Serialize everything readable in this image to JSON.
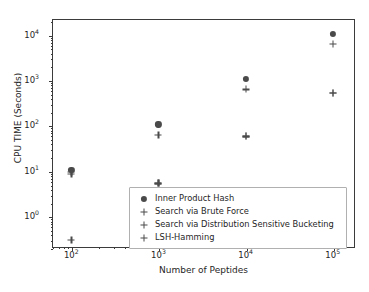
{
  "chart_data": {
    "type": "scatter",
    "title": "",
    "xlabel": "Number of Peptides",
    "ylabel": "CPU TIME (Seconds)",
    "xscale": "log",
    "yscale": "log",
    "xlim": [
      60,
      180000
    ],
    "ylim": [
      0.2,
      22000
    ],
    "grid": false,
    "legend_position": "lower center",
    "xticklabels": [
      "10²",
      "10³",
      "10⁴",
      "10⁵"
    ],
    "xtickvalues": [
      100,
      1000,
      10000,
      100000
    ],
    "yticklabels": [
      "10⁰",
      "10¹",
      "10²",
      "10³",
      "10⁴"
    ],
    "ytickvalues": [
      1,
      10,
      100,
      1000,
      10000
    ],
    "x": [
      100,
      1000,
      10000,
      100000
    ],
    "series": [
      {
        "name": "Inner Product Hash",
        "marker": "circle",
        "color": "#4a4a4a",
        "x": [
          100,
          1000,
          10000,
          100000
        ],
        "values": [
          10.5,
          105,
          1050,
          10500
        ]
      },
      {
        "name": "Search via Brute Force",
        "marker": "plus",
        "color": "#4a4a4a",
        "x": [
          100,
          1000,
          10000,
          100000
        ],
        "values": [
          8.5,
          62,
          620,
          6200
        ]
      },
      {
        "name": "Search via Distribution Sensitive Bucketing",
        "marker": "plus",
        "color": "#4a4a4a",
        "x": [
          100,
          1000,
          10000,
          100000
        ],
        "values": [
          9.5,
          5.3,
          57,
          530
        ]
      },
      {
        "name": "LSH-Hamming",
        "marker": "plus",
        "color": "#4a4a4a",
        "x": [
          100,
          1000,
          10000,
          100000
        ],
        "values": [
          0.3,
          5.3,
          57,
          530
        ]
      }
    ]
  },
  "legend": {
    "entries": [
      {
        "label": "Inner Product Hash",
        "marker": "circle"
      },
      {
        "label": "Search via Brute Force",
        "marker": "plus"
      },
      {
        "label": "Search via Distribution Sensitive Bucketing",
        "marker": "plus"
      },
      {
        "label": "LSH-Hamming",
        "marker": "plus"
      }
    ]
  },
  "axes": {
    "xlabel": "Number of Peptides",
    "ylabel": "CPU TIME (Seconds)"
  },
  "colors": {
    "marker": "#4a4a4a",
    "axis": "#3b3b3b",
    "text": "#262626",
    "background": "#ffffff",
    "legend_border": "#b0b0b0"
  }
}
